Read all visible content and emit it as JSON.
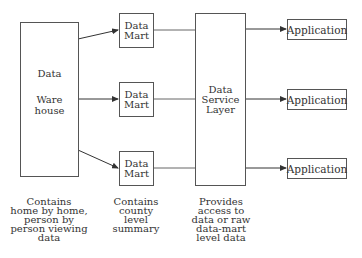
{
  "warehouse": {
    "line1": "Data",
    "line2": "Ware",
    "line3": "house",
    "caption": "Contains\nhome by home,\nperson by\nperson viewing\ndata"
  },
  "data_marts": [
    {
      "line1": "Data",
      "line2": "Mart"
    },
    {
      "line1": "Data",
      "line2": "Mart"
    },
    {
      "line1": "Data",
      "line2": "Mart"
    }
  ],
  "data_mart_caption": "Contains\ncounty\nlevel\nsummary",
  "service_layer": {
    "line1": "Data",
    "line2": "Service",
    "line3": "Layer",
    "caption": "Provides\naccess to\ndata or raw\ndata-mart\nlevel data"
  },
  "applications": [
    {
      "label": "Application"
    },
    {
      "label": "Application"
    },
    {
      "label": "Application"
    }
  ],
  "colors": {
    "stroke": "#555555",
    "text": "#333333",
    "background": "#ffffff"
  }
}
